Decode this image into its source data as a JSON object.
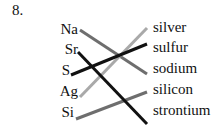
{
  "question_number": "8.",
  "left_items": [
    {
      "label": "Na",
      "y": 22
    },
    {
      "label": "Sr",
      "y": 42
    },
    {
      "label": "S",
      "y": 63
    },
    {
      "label": "Ag",
      "y": 84
    },
    {
      "label": "Si",
      "y": 105
    }
  ],
  "right_items": [
    {
      "label": "silver",
      "y": 20
    },
    {
      "label": "sulfur",
      "y": 40
    },
    {
      "label": "sodium",
      "y": 61
    },
    {
      "label": "silicon",
      "y": 82
    },
    {
      "label": "strontium",
      "y": 103
    }
  ],
  "matches": [
    {
      "from": "Na",
      "to": "sodium",
      "style": "gray-hatched"
    },
    {
      "from": "Sr",
      "to": "strontium",
      "style": "black"
    },
    {
      "from": "S",
      "to": "sulfur",
      "style": "black"
    },
    {
      "from": "Ag",
      "to": "silver",
      "style": "light-gray-hatched"
    },
    {
      "from": "Si",
      "to": "silicon",
      "style": "gray-hatched"
    }
  ],
  "colors": {
    "black": "#111111",
    "gray": "#6e6e6e",
    "light_gray": "#a9a9a9"
  }
}
